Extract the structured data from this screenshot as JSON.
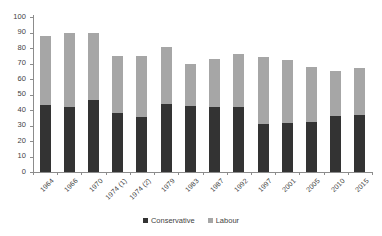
{
  "chart_data": {
    "type": "bar",
    "stacked": true,
    "title": "",
    "subtitle": "",
    "xlabel": "",
    "ylabel": "",
    "ylim": [
      0,
      100
    ],
    "ytick_step": 10,
    "yticks": [
      0,
      10,
      20,
      30,
      40,
      50,
      60,
      70,
      80,
      90,
      100
    ],
    "ytick_labels": [
      "0",
      "10",
      "20",
      "30",
      "40",
      "50",
      "60",
      "70",
      "80",
      "90",
      "100"
    ],
    "grid": false,
    "legend_position": "bottom",
    "categories": [
      "1964",
      "1966",
      "1970",
      "1974 (1)",
      "1974 (2)",
      "1979",
      "1983",
      "1987",
      "1992",
      "1997",
      "2001",
      "2005",
      "2010",
      "2015"
    ],
    "series": [
      {
        "name": "Conservative",
        "color": "#333333",
        "values": [
          43.4,
          41.9,
          46.4,
          37.9,
          35.8,
          43.9,
          42.4,
          42.2,
          41.9,
          30.7,
          31.7,
          32.4,
          36.1,
          36.9
        ]
      },
      {
        "name": "Labour",
        "color": "#a6a6a6",
        "values": [
          44.1,
          48.0,
          43.1,
          37.2,
          39.2,
          36.9,
          27.6,
          30.8,
          34.4,
          43.2,
          40.7,
          35.2,
          29.0,
          30.4
        ]
      }
    ],
    "totals": [
      87.5,
      89.9,
      89.5,
      75.1,
      75.0,
      80.8,
      70.0,
      73.0,
      76.3,
      73.9,
      72.4,
      67.6,
      65.1,
      67.3
    ]
  },
  "legend": {
    "items": [
      {
        "label": "Conservative",
        "color": "#333333",
        "marker": "square-marker-icon"
      },
      {
        "label": "Labour",
        "color": "#a6a6a6",
        "marker": "square-marker-icon"
      }
    ]
  },
  "colors": {
    "conservative": "#333333",
    "labour": "#a6a6a6",
    "axis": "#8c8c8c",
    "text": "#3f3f3f",
    "background": "#ffffff"
  }
}
